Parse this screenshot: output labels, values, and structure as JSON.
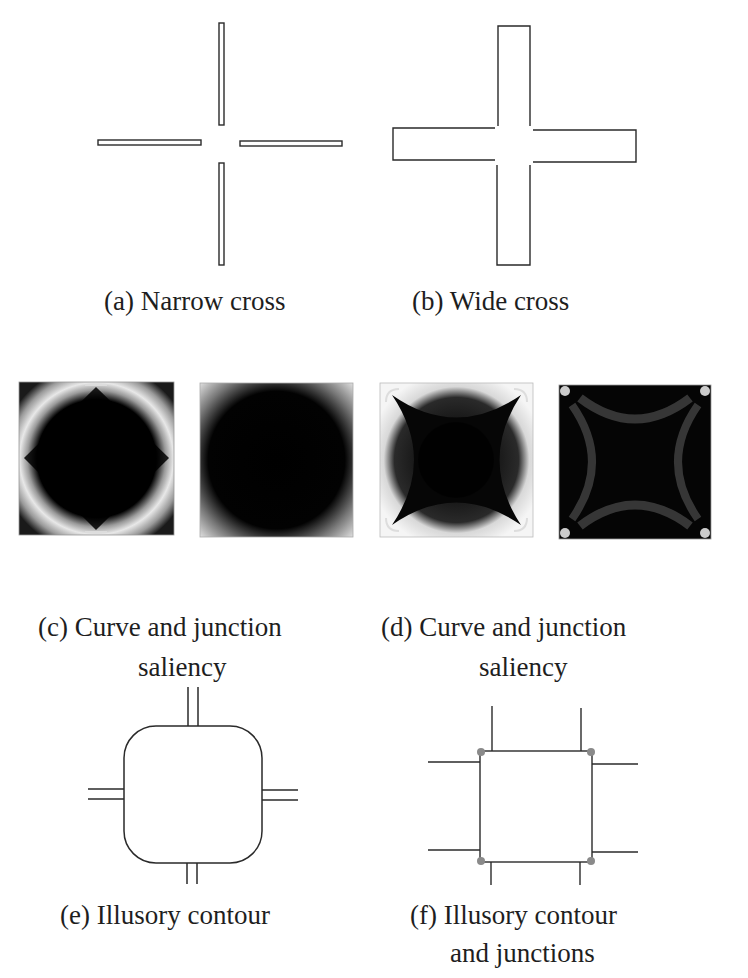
{
  "figure": {
    "panels": [
      {
        "id": "a",
        "label": "(a) Narrow cross",
        "type": "line-drawing",
        "shape": "narrow-cross"
      },
      {
        "id": "b",
        "label": "(b) Wide cross",
        "type": "line-drawing",
        "shape": "wide-cross"
      },
      {
        "id": "c",
        "label_line1": "(c) Curve and junction",
        "label_line2": "saliency",
        "type": "saliency-map-pair",
        "maps": [
          "curve-saliency",
          "junction-saliency"
        ]
      },
      {
        "id": "d",
        "label_line1": "(d) Curve and junction",
        "label_line2": "saliency",
        "type": "saliency-map-pair",
        "maps": [
          "curve-saliency",
          "junction-saliency"
        ]
      },
      {
        "id": "e",
        "label": "(e) Illusory contour",
        "type": "line-drawing",
        "shape": "rounded-illusory-contour"
      },
      {
        "id": "f",
        "label_line1": "(f) Illusory contour",
        "label_line2": "and junctions",
        "type": "line-drawing",
        "shape": "square-illusory-contour-with-junctions"
      }
    ],
    "colors": {
      "stroke": "#2a2a2a",
      "background": "#ffffff",
      "saliency_dark": "#050505",
      "saliency_bright": "#f2f2f2",
      "junction_marker": "#8a8a8a"
    }
  }
}
